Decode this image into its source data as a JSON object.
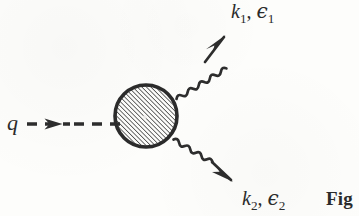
{
  "figure": {
    "type": "feynman-diagram",
    "background_color": "#fdfdfb",
    "ink_color": "#2b2b2b"
  },
  "labels": {
    "incoming": {
      "symbol": "q",
      "full_text": "q"
    },
    "outgoing_upper": {
      "momentum": "k",
      "momentum_sub": "1",
      "separator": ", ",
      "polarization": "ϵ",
      "polarization_sub": "1",
      "full_text": "k₁, ϵ₁"
    },
    "outgoing_lower": {
      "momentum": "k",
      "momentum_sub": "2",
      "separator": ", ",
      "polarization": "ϵ",
      "polarization_sub": "2",
      "full_text": "k₂, ϵ₂"
    },
    "caption": {
      "text": "Fig"
    }
  },
  "elements": {
    "blob": {
      "name": "hatched-vertex-blob",
      "shape": "circle",
      "center_x": 146,
      "center_y": 116,
      "radius": 32,
      "border_width": 3.6,
      "fill_pattern": "diagonal-hatch",
      "hatch_angle_deg": 45,
      "hatch_spacing": 3.2,
      "color": "#2b2b2b"
    },
    "incoming_line": {
      "name": "dashed-incoming-line",
      "style": "dashed",
      "x1": 27,
      "y1": 124,
      "x2": 116,
      "y2": 124,
      "dash_pattern": "9 7",
      "stroke_width": 3.4,
      "arrow_at_x": 57,
      "arrow_direction": "right"
    },
    "photon_upper": {
      "name": "wavy-photon-line-upper",
      "style": "wavy",
      "x1": 177,
      "y1": 98,
      "x2": 222,
      "y2": 42,
      "stroke_width": 2.6,
      "wave_amplitude": 3.1,
      "wave_period": 10,
      "arrow_direction": "up-right"
    },
    "photon_lower": {
      "name": "wavy-photon-line-lower",
      "style": "wavy",
      "x1": 174,
      "y1": 140,
      "x2": 228,
      "y2": 180,
      "stroke_width": 2.6,
      "wave_amplitude": 3.1,
      "wave_period": 10,
      "arrow_direction": "down-right"
    }
  }
}
